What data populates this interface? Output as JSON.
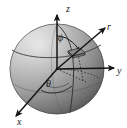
{
  "figure": {
    "name": "spherical-coordinate-sphere-diagram",
    "type": "3d-vector-diagram",
    "background_color": "#ffffff",
    "sphere": {
      "center": [
        57,
        69
      ],
      "radius_x": 47,
      "radius_y": 45,
      "fill_light": "#f2f2f2",
      "fill_mid": "#b5b5b5",
      "fill_dark": "#6b6b6b",
      "outline_color": "#4a4a4a"
    },
    "axes": [
      {
        "name": "z-axis",
        "label": "z",
        "label_pos": [
          66,
          11
        ],
        "tip": [
          57,
          12
        ],
        "origin": [
          57,
          69
        ]
      },
      {
        "name": "y-axis",
        "label": "y",
        "label_pos": [
          118,
          72
        ],
        "tip": [
          113,
          67
        ],
        "origin": [
          57,
          69
        ]
      },
      {
        "name": "x-axis",
        "label": "x",
        "label_pos": [
          20,
          122
        ],
        "tip": [
          15,
          115
        ],
        "origin": [
          57,
          69
        ]
      }
    ],
    "vector": {
      "name": "r-vector",
      "label": "r",
      "label_pos": [
        110,
        29
      ],
      "origin": [
        57,
        69
      ],
      "tip": [
        107,
        27
      ]
    },
    "angles": [
      {
        "name": "phi-angle",
        "label": "ϕ",
        "label_pos": [
          62,
          38
        ]
      },
      {
        "name": "theta-angle",
        "label": "θ",
        "label_pos": [
          49,
          83
        ]
      }
    ],
    "surface_patch": {
      "name": "area-element-patch",
      "center": [
        76,
        52
      ],
      "fill": "#8a8a8a"
    },
    "line_color": "#1a1a1a",
    "dashed_line_color": "#2b2b2b"
  }
}
